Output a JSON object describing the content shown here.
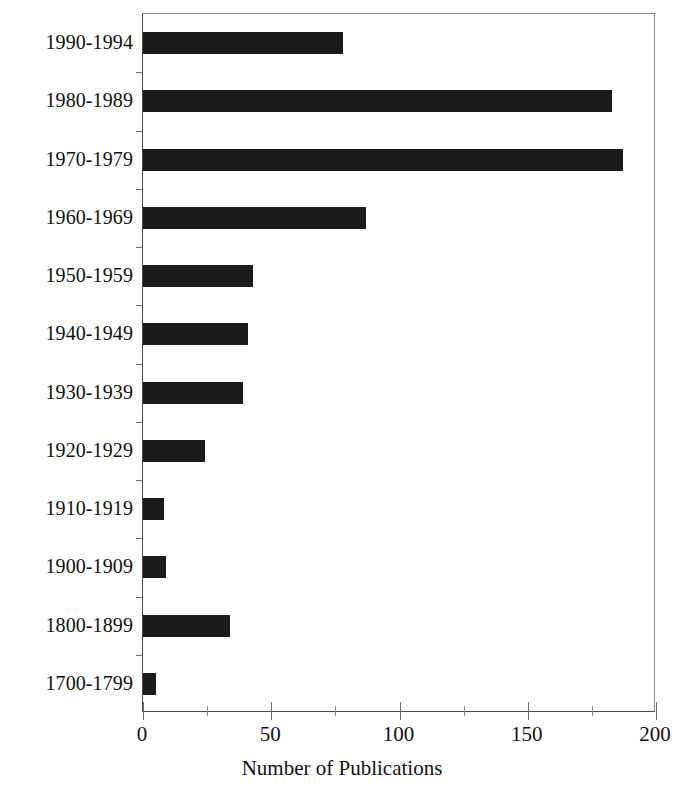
{
  "chart_data": {
    "type": "bar",
    "orientation": "horizontal",
    "title": "",
    "xlabel": "Number of Publications",
    "ylabel": "",
    "xlim": [
      0,
      200
    ],
    "xticks": [
      0,
      50,
      100,
      150,
      200
    ],
    "xtick_labels": [
      "0",
      "50",
      "100",
      "150",
      "200"
    ],
    "xminor_ticks": [
      25,
      75,
      125,
      175
    ],
    "grid": false,
    "legend": false,
    "bar_color": "#1b1b1b",
    "categories": [
      "1990-1994",
      "1980-1989",
      "1970-1979",
      "1960-1969",
      "1950-1959",
      "1940-1949",
      "1930-1939",
      "1920-1929",
      "1910-1919",
      "1900-1909",
      "1800-1899",
      "1700-1799"
    ],
    "values": [
      78,
      183,
      187,
      87,
      43,
      41,
      39,
      24,
      8,
      9,
      34,
      5
    ]
  }
}
